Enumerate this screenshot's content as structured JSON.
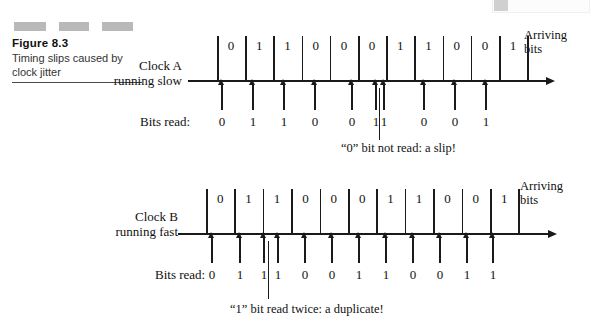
{
  "caption": {
    "figure_number": "Figure 8.3",
    "description": "Timing slips caused by clock jitter"
  },
  "diagrams": [
    {
      "id": "clock-a",
      "clock_label": "Clock A running slow",
      "arriving_label_line1": "Arriving",
      "arriving_label_line2": "bits",
      "bits_read_label": "Bits read:",
      "arriving_bits": [
        "0",
        "1",
        "1",
        "0",
        "0",
        "0",
        "1",
        "1",
        "0",
        "0",
        "1"
      ],
      "bits_read": [
        "0",
        "1",
        "1",
        "0",
        "0",
        "1",
        "1",
        "0",
        "0",
        "1"
      ],
      "annotation": "“0” bit not read: a slip!"
    },
    {
      "id": "clock-b",
      "clock_label": "Clock B running fast",
      "arriving_label_line1": "Arriving",
      "arriving_label_line2": "bits",
      "bits_read_label": "Bits read:",
      "arriving_bits": [
        "0",
        "1",
        "1",
        "0",
        "0",
        "0",
        "1",
        "1",
        "0",
        "0",
        "1"
      ],
      "bits_read": [
        "0",
        "1",
        "1",
        "1",
        "0",
        "0",
        "1",
        "1",
        "0",
        "0",
        "1",
        "1"
      ],
      "annotation": "“1” bit read twice: a duplicate!"
    }
  ],
  "chart_data": {
    "type": "timing-diagram",
    "title": "Timing slips caused by clock jitter",
    "panels": [
      {
        "name": "Clock A running slow",
        "arriving_bits": [
          "0",
          "1",
          "1",
          "0",
          "0",
          "0",
          "1",
          "1",
          "0",
          "0",
          "1"
        ],
        "sampled_bits": [
          "0",
          "1",
          "1",
          "0",
          "0",
          "1",
          "1",
          "0",
          "0",
          "1"
        ],
        "arriving_count": 11,
        "sampled_count": 10,
        "event": "slip",
        "event_note": "“0” bit not read: a slip!",
        "event_cell_index": 5
      },
      {
        "name": "Clock B running fast",
        "arriving_bits": [
          "0",
          "1",
          "1",
          "0",
          "0",
          "0",
          "1",
          "1",
          "0",
          "0",
          "1"
        ],
        "sampled_bits": [
          "0",
          "1",
          "1",
          "1",
          "0",
          "0",
          "1",
          "1",
          "0",
          "0",
          "1",
          "1"
        ],
        "arriving_count": 11,
        "sampled_count": 12,
        "event": "duplicate",
        "event_note": "“1” bit read twice: a duplicate!",
        "event_cell_index": 2
      }
    ],
    "colors": {
      "ink": "#1a1a1a",
      "deco_bar": "#b9b9b9"
    }
  }
}
